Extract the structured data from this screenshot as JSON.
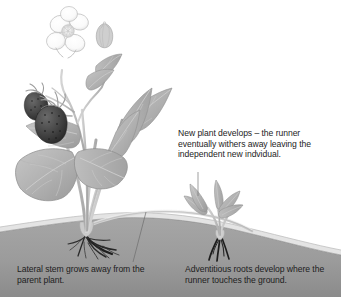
{
  "diagram": {
    "style": "grayscale-botanical-illustration"
  },
  "callouts": [
    {
      "id": "new-plant",
      "text": "New plant develops – the runner eventually withers away leaving the independent new indvidual.",
      "leader": "vertical-line-down-to-daughter-plant"
    },
    {
      "id": "lateral-stem",
      "text": "Lateral stem grows away from the parent plant.",
      "leader": "diagonal-line-up-right-to-runner"
    },
    {
      "id": "adventitious-roots",
      "text": "Adventitious roots develop where the runner touches the ground.",
      "leader": "none"
    }
  ],
  "labels": {
    "parent_plant": "parent-strawberry-plant",
    "daughter_plant": "daughter-strawberry-plant",
    "runner": "runner-stolon",
    "ground": "soil-ground",
    "flower": "strawberry-flower",
    "bud": "flower-bud",
    "berries": "strawberry-fruits",
    "parent_roots": "parent-plant-roots",
    "adventitious_roots": "adventitious-roots"
  },
  "colors": {
    "background": "#ffffff",
    "text": "#1d1d1d",
    "soil_fill": "#9b9b9b",
    "soil_shadow": "#8d8d8d",
    "soil_highlight": "#dedede",
    "leaf_fill": "#b0b0b0",
    "leaf_dark": "#9a9a9a",
    "leaf_light": "#c8c8c8",
    "leaf_outline": "#8a8a8a",
    "vein": "#cfcfcf",
    "stem": "#c2c2c2",
    "stem_outline": "#a2a2a2",
    "petal": "#fbfbfb",
    "petal_outline": "#b5b5b5",
    "flower_center": "#d8d8d8",
    "berry_fill": "#4a4a4a",
    "berry_dark": "#2e2e2e",
    "berry_seed": "#1a1a1a",
    "root_dark": "#1e1e1e",
    "runner_line": "#b8b8b8",
    "leader_line": "#6e6e6e"
  }
}
